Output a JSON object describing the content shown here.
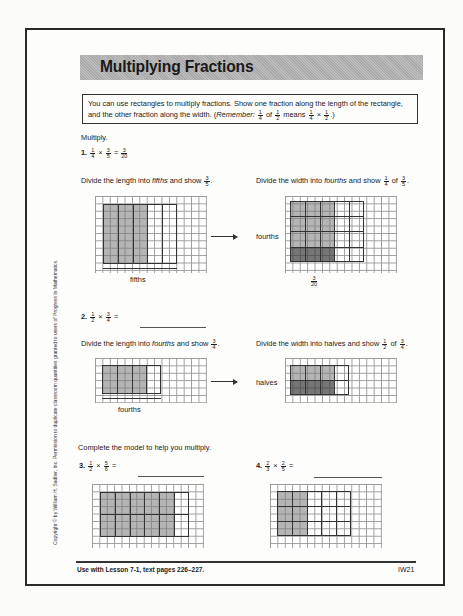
{
  "title": "Multiplying Fractions",
  "intro": {
    "text": "You can use rectangles to multiply fractions. Show one fraction along the length of the rectangle, and the other fraction along the width. (",
    "remember_label": "Remember:",
    "remember_expr": {
      "a": {
        "n": "1",
        "d": "4"
      },
      "of": "of",
      "b": {
        "n": "1",
        "d": "2"
      },
      "means": "means",
      "c": {
        "n": "1",
        "d": "4"
      },
      "times": "×",
      "e": {
        "n": "1",
        "d": "2"
      }
    },
    "closing": ".)"
  },
  "section1_label": "Multiply.",
  "problems": [
    {
      "number": "1.",
      "a": {
        "n": "1",
        "d": "4"
      },
      "b": {
        "n": "3",
        "d": "5"
      },
      "op": "×",
      "eq": "=",
      "answer": {
        "n": "3",
        "d": "20"
      },
      "left_instruction": {
        "pre": "Divide the length into ",
        "em": "fifths",
        "post": " and show ",
        "frac": {
          "n": "3",
          "d": "5"
        },
        "end": "."
      },
      "right_instruction": {
        "pre": "Divide the width into ",
        "em": "fourths",
        "post": " and show ",
        "frac1": {
          "n": "1",
          "d": "4"
        },
        "of": "of",
        "frac2": {
          "n": "3",
          "d": "5"
        },
        "end": "."
      },
      "left_label": "fifths",
      "right_label": "fourths",
      "result_label": {
        "n": "3",
        "d": "20"
      }
    },
    {
      "number": "2.",
      "a": {
        "n": "1",
        "d": "2"
      },
      "b": {
        "n": "3",
        "d": "4"
      },
      "op": "×",
      "eq": "=",
      "answer": "",
      "left_instruction": {
        "pre": "Divide the length into ",
        "em": "fourths",
        "post": " and show ",
        "frac": {
          "n": "3",
          "d": "4"
        },
        "end": "."
      },
      "right_instruction": {
        "pre": "Divide the width into halves and show ",
        "frac1": {
          "n": "1",
          "d": "2"
        },
        "of": "of",
        "frac2": {
          "n": "3",
          "d": "4"
        },
        "end": "."
      },
      "left_label": "fourths",
      "right_label": "halves"
    },
    {
      "number": "3.",
      "a": {
        "n": "1",
        "d": "2"
      },
      "b": {
        "n": "5",
        "d": "6"
      },
      "op": "×",
      "eq": "=",
      "answer": ""
    },
    {
      "number": "4.",
      "a": {
        "n": "2",
        "d": "3"
      },
      "b": {
        "n": "2",
        "d": "5"
      },
      "op": "×",
      "eq": "=",
      "answer": ""
    }
  ],
  "section2_label": "Complete the model to help you multiply.",
  "footer": {
    "left": "Use with Lesson 7-1, text pages 226–227.",
    "right": "IW21"
  },
  "copyright": "Copyright © by William H. Sadlier, Inc. Permission to duplicate classroom quantities granted to users of Progress in Mathematics."
}
